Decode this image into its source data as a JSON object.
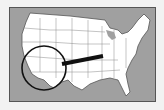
{
  "map": {
    "subject": "United States map",
    "highlight_region": "California / Nevada (Western US)",
    "colors": {
      "water": "#a0a0a0",
      "land": "#ffffff",
      "borders": "#666666",
      "magnifier": "#111111",
      "background": "#f2f2f2"
    }
  }
}
